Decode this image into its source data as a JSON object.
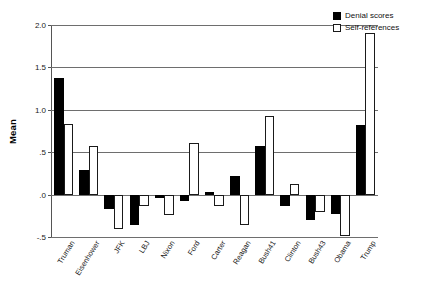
{
  "chart_data": {
    "type": "bar",
    "title": "",
    "xlabel": "",
    "ylabel": "Mean",
    "ylim": [
      -0.5,
      2.0
    ],
    "yticks": [
      "-.5",
      ".0",
      ".5",
      "1.0",
      "1.5",
      "2.0"
    ],
    "ytick_values": [
      -0.5,
      0.0,
      0.5,
      1.0,
      1.5,
      2.0
    ],
    "grid": true,
    "legend_position": "top-right",
    "categories": [
      "Truman",
      "Eisenhower",
      "JFK",
      "LBJ",
      "Nixon",
      "Ford",
      "Carter",
      "Reagan",
      "Bush41",
      "Clinton",
      "Bush43",
      "Obama",
      "Trump"
    ],
    "series": [
      {
        "name": "Denial scores",
        "color": "#000000",
        "values": [
          1.38,
          0.29,
          -0.17,
          -0.36,
          -0.04,
          -0.07,
          0.03,
          0.22,
          0.57,
          -0.14,
          -0.3,
          -0.23,
          0.82
        ]
      },
      {
        "name": "Self-references",
        "color": "#ffffff",
        "values": [
          0.83,
          0.57,
          -0.41,
          -0.13,
          -0.24,
          0.61,
          -0.13,
          -0.36,
          0.93,
          0.12,
          -0.2,
          -0.49,
          1.9
        ]
      }
    ]
  },
  "legend": {
    "items": [
      {
        "label": "Denial scores",
        "swatch": "filled-square-icon"
      },
      {
        "label": "Self-references",
        "swatch": "outlined-square-icon"
      }
    ]
  }
}
